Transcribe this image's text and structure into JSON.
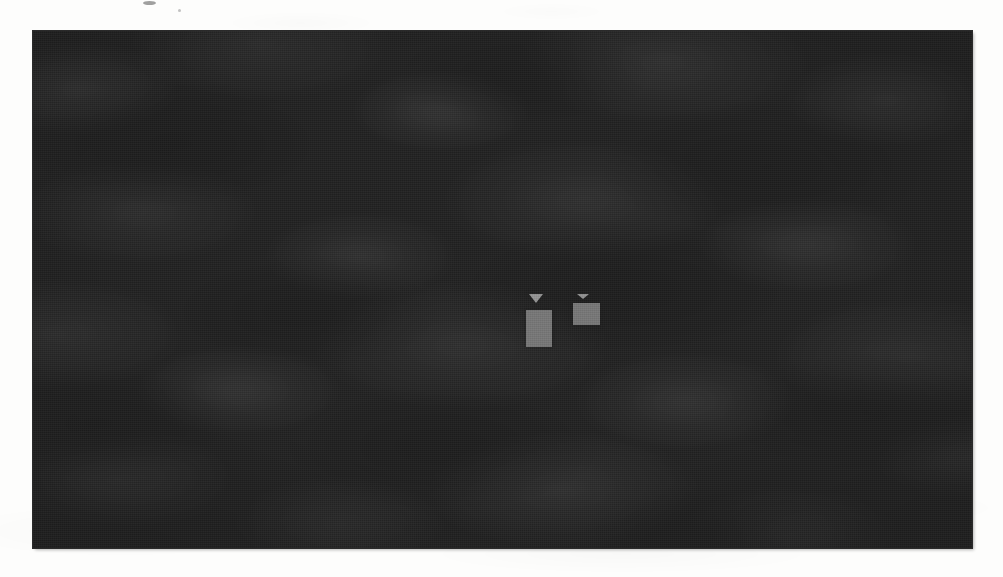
{
  "figure": {
    "kind": "dark-photographic-panel",
    "description": "Very dark, coarsely halftoned monochrome photograph of textured ground, with two bright rectangular markers near the centre",
    "background_color": "#111111",
    "page_color": "#fdfdfc",
    "frame_border_color": "#2a2a2a",
    "panel": {
      "x": 33,
      "y": 31,
      "width": 939,
      "height": 517
    },
    "texture": {
      "name": "halftone-dot-screen",
      "tone": "near-black mottled",
      "dot_pitch_px": 2
    }
  },
  "markers": [
    {
      "id": "marker-left",
      "label": "",
      "shape": "vertical-rectangle-with-down-triangle",
      "triangle_direction": "down",
      "fill_color": "#8c8c8c",
      "triangle_color": "#e6e6e6",
      "x": 493,
      "y": 263,
      "box_width": 26,
      "box_height": 37
    },
    {
      "id": "marker-right",
      "label": "",
      "shape": "horizontal-rectangle-with-down-triangle",
      "triangle_direction": "down",
      "fill_color": "#8c8c8c",
      "triangle_color": "#e0e0e0",
      "x": 540,
      "y": 263,
      "box_width": 27,
      "box_height": 22
    }
  ],
  "artifacts": {
    "scan_speck_note": "small dark scan speck near the top edge of the page margin"
  },
  "caption": ""
}
